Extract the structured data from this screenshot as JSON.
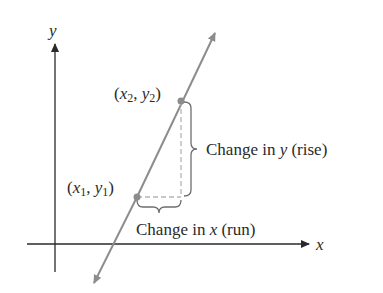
{
  "diagram": {
    "axes": {
      "x_label": "x",
      "y_label": "y"
    },
    "points": [
      {
        "id": "p1",
        "label_open": "(",
        "var_x": "x",
        "sub_x": "1",
        "sep": ", ",
        "var_y": "y",
        "sub_y": "1",
        "label_close": ")"
      },
      {
        "id": "p2",
        "label_open": "(",
        "var_x": "x",
        "sub_x": "2",
        "sep": ", ",
        "var_y": "y",
        "sub_y": "2",
        "label_close": ")"
      }
    ],
    "annotations": {
      "rise": {
        "prefix": "Change in ",
        "var": "y",
        "suffix": " (rise)"
      },
      "run": {
        "prefix": "Change in ",
        "var": "x",
        "suffix": " (run)"
      }
    },
    "colors": {
      "axis": "#2a2a2a",
      "line": "#8c8c8c",
      "point": "#8c8c8c",
      "dashed": "#b5b5b5",
      "brace": "#6e6e6e",
      "text": "#2a2a2a"
    }
  }
}
